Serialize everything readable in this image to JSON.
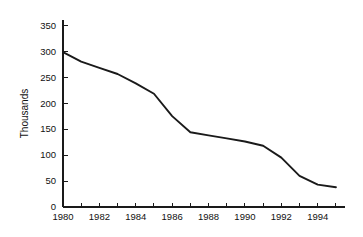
{
  "chart_data": {
    "type": "line",
    "title": "",
    "subtitle": "",
    "xlabel": "",
    "ylabel": "Thousands",
    "x": [
      1980,
      1981,
      1982,
      1983,
      1984,
      1985,
      1986,
      1987,
      1988,
      1989,
      1990,
      1991,
      1992,
      1993,
      1994,
      1995
    ],
    "values": [
      298,
      280,
      268,
      256,
      238,
      218,
      175,
      144,
      138,
      132,
      126,
      118,
      95,
      60,
      43,
      38
    ],
    "series": [
      {
        "name": "Thousands",
        "values": [
          298,
          280,
          268,
          256,
          238,
          218,
          175,
          144,
          138,
          132,
          126,
          118,
          95,
          60,
          43,
          38
        ]
      }
    ],
    "xlim": [
      1980,
      1995.5
    ],
    "ylim": [
      0,
      360
    ],
    "y_ticks": [
      0,
      50,
      100,
      150,
      200,
      250,
      300,
      350
    ],
    "y_tick_labels": [
      "0",
      "50",
      "100",
      "150",
      "200",
      "250",
      "300",
      "350"
    ],
    "x_ticks": [
      1980,
      1981,
      1982,
      1983,
      1984,
      1985,
      1986,
      1987,
      1988,
      1989,
      1990,
      1991,
      1992,
      1993,
      1994,
      1995
    ],
    "x_tick_labels": [
      "1980",
      "",
      "1982",
      "",
      "1984",
      "",
      "1986",
      "",
      "1988",
      "",
      "1990",
      "",
      "1992",
      "",
      "1994",
      ""
    ],
    "grid": false,
    "legend": false,
    "legend_position": "none",
    "line_color": "#1a1a1a",
    "background_color": "#ffffff",
    "annotations": []
  },
  "axis_labels": {
    "y_title": "Thousands"
  }
}
